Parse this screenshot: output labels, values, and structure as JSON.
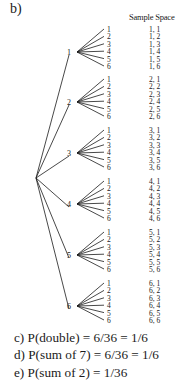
{
  "part_label": "b)",
  "sample_space_header": "Sample Space",
  "tree": {
    "root": {
      "x": 36,
      "y": 178
    },
    "first_roll": [
      {
        "label": "1",
        "x": 74,
        "y": 52,
        "leaf_top": 31
      },
      {
        "label": "2",
        "x": 74,
        "y": 102,
        "leaf_top": 81
      },
      {
        "label": "3",
        "x": 74,
        "y": 153,
        "leaf_top": 132
      },
      {
        "label": "4",
        "x": 74,
        "y": 204,
        "leaf_top": 183
      },
      {
        "label": "5",
        "x": 74,
        "y": 255,
        "leaf_top": 234
      },
      {
        "label": "6",
        "x": 74,
        "y": 306,
        "leaf_top": 285
      }
    ],
    "second_roll_labels": [
      "1",
      "2",
      "3",
      "4",
      "5",
      "6"
    ],
    "leaf_spacing": 7.4
  },
  "sample_space": [
    [
      "1, 1",
      "1, 2",
      "1, 3",
      "1, 4",
      "1, 5",
      "1, 6"
    ],
    [
      "2, 1",
      "2, 2",
      "2, 3",
      "2, 4",
      "2, 5",
      "2, 6"
    ],
    [
      "3, 1",
      "3, 2",
      "3, 3",
      "3, 4",
      "3, 5",
      "3, 6"
    ],
    [
      "4, 1",
      "4, 2",
      "4, 3",
      "4, 4",
      "4, 5",
      "4, 6"
    ],
    [
      "5, 1",
      "5, 2",
      "5, 3",
      "5, 4",
      "5, 5",
      "5, 6"
    ],
    [
      "6, 1",
      "6, 2",
      "6, 3",
      "6, 4",
      "6, 5",
      "6, 6"
    ]
  ],
  "answers": {
    "c": "c)  P(double) = 6/36 = 1/6",
    "d": "d)  P(sum of 7) = 6/36 = 1/6",
    "e": "e)  P(sum of 2) = 1/36"
  },
  "colors": {
    "ink": "#1a1a1a",
    "background": "#ffffff"
  }
}
